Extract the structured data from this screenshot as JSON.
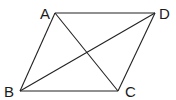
{
  "figure": {
    "type": "parallelogram-with-diagonals",
    "line_color": "#222222",
    "label_color": "#1a1a1a",
    "vertices": {
      "A": {
        "label": "A",
        "x": 55,
        "y": 13
      },
      "B": {
        "label": "B",
        "x": 20,
        "y": 91
      },
      "C": {
        "label": "C",
        "x": 118,
        "y": 91
      },
      "D": {
        "label": "D",
        "x": 155,
        "y": 13
      }
    },
    "sides": [
      "AD",
      "DC",
      "CB",
      "BA"
    ],
    "diagonals": [
      "AC",
      "BD"
    ]
  }
}
